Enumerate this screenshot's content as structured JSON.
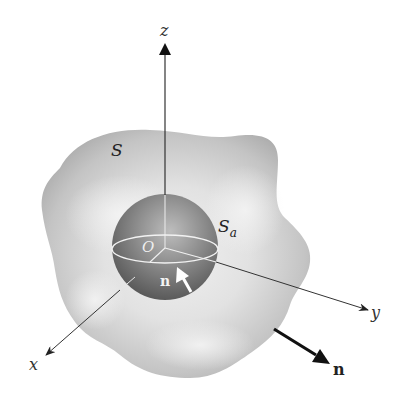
{
  "figure": {
    "labels": {
      "z_axis": "z",
      "y_axis": "y",
      "x_axis": "x",
      "outer_surface": "S",
      "sphere_surface": "S",
      "sphere_subscript": "a",
      "origin": "O",
      "inner_normal": "n",
      "outer_normal": "n"
    },
    "colors": {
      "background": "#ffffff",
      "outer_surface_fill": "#c8c8c8",
      "outer_surface_highlight": "#ebebeb",
      "sphere_fill_dark": "#6e6e6e",
      "sphere_fill_light": "#b4b4b4",
      "axis_line": "#333333",
      "normal_arrow_outer": "#111111",
      "normal_arrow_inner": "#ffffff",
      "equator_line": "#f0f0f0"
    }
  }
}
